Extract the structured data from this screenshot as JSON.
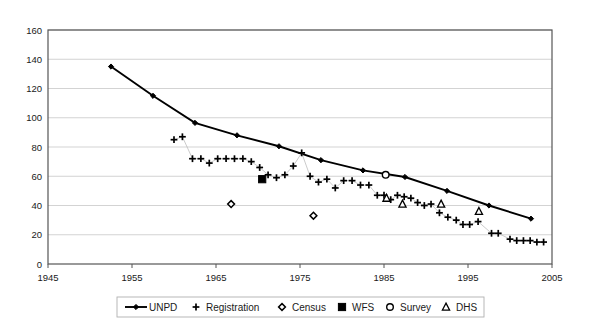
{
  "chart_data": {
    "type": "scatter",
    "title": "",
    "xlabel": "",
    "ylabel": "",
    "xlim": [
      1945,
      2005
    ],
    "ylim": [
      0,
      160
    ],
    "xticks": [
      1945,
      1955,
      1965,
      1975,
      1985,
      1995,
      2005
    ],
    "yticks": [
      0,
      20,
      40,
      60,
      80,
      100,
      120,
      140,
      160
    ],
    "grid": "horizontal",
    "legend_position": "bottom",
    "colors": {
      "line": "#000000",
      "marker": "#000000",
      "grid": "#c8c8c8",
      "frame": "#555555",
      "background": "#ffffff"
    },
    "series": [
      {
        "name": "UNPD",
        "marker": "line-diamond",
        "connected": true,
        "points": [
          {
            "x": 1952.5,
            "y": 135
          },
          {
            "x": 1957.5,
            "y": 115
          },
          {
            "x": 1962.5,
            "y": 96.5
          },
          {
            "x": 1967.5,
            "y": 88
          },
          {
            "x": 1972.5,
            "y": 80.5
          },
          {
            "x": 1977.5,
            "y": 71
          },
          {
            "x": 1982.5,
            "y": 64
          },
          {
            "x": 1987.5,
            "y": 59.5
          },
          {
            "x": 1992.5,
            "y": 50
          },
          {
            "x": 1997.5,
            "y": 40
          },
          {
            "x": 2002.5,
            "y": 31
          }
        ]
      },
      {
        "name": "Registration",
        "marker": "plus",
        "connected": true,
        "points": [
          {
            "x": 1960.0,
            "y": 85
          },
          {
            "x": 1961.0,
            "y": 87
          },
          {
            "x": 1962.2,
            "y": 72
          },
          {
            "x": 1963.2,
            "y": 72
          },
          {
            "x": 1964.2,
            "y": 69
          },
          {
            "x": 1965.2,
            "y": 72
          },
          {
            "x": 1966.2,
            "y": 72
          },
          {
            "x": 1967.2,
            "y": 72
          },
          {
            "x": 1968.2,
            "y": 72
          },
          {
            "x": 1969.2,
            "y": 70
          },
          {
            "x": 1970.2,
            "y": 66
          },
          {
            "x": 1971.2,
            "y": 61
          },
          {
            "x": 1972.2,
            "y": 59
          },
          {
            "x": 1973.2,
            "y": 61
          },
          {
            "x": 1974.2,
            "y": 67
          },
          {
            "x": 1975.2,
            "y": 76
          },
          {
            "x": 1976.2,
            "y": 60
          },
          {
            "x": 1977.2,
            "y": 56
          },
          {
            "x": 1978.2,
            "y": 58
          },
          {
            "x": 1979.2,
            "y": 52
          },
          {
            "x": 1980.2,
            "y": 57
          },
          {
            "x": 1981.2,
            "y": 57
          },
          {
            "x": 1982.2,
            "y": 54
          },
          {
            "x": 1983.2,
            "y": 54
          },
          {
            "x": 1984.2,
            "y": 47
          },
          {
            "x": 1985.0,
            "y": 47
          },
          {
            "x": 1985.8,
            "y": 44
          },
          {
            "x": 1986.6,
            "y": 47
          },
          {
            "x": 1987.4,
            "y": 46
          },
          {
            "x": 1988.2,
            "y": 45
          },
          {
            "x": 1989.0,
            "y": 42
          },
          {
            "x": 1989.8,
            "y": 40
          },
          {
            "x": 1990.6,
            "y": 41
          },
          {
            "x": 1991.6,
            "y": 35
          },
          {
            "x": 1992.6,
            "y": 32
          },
          {
            "x": 1993.6,
            "y": 30
          },
          {
            "x": 1994.4,
            "y": 27
          },
          {
            "x": 1995.2,
            "y": 27
          },
          {
            "x": 1996.2,
            "y": 29
          },
          {
            "x": 1997.8,
            "y": 21
          },
          {
            "x": 1998.6,
            "y": 21
          },
          {
            "x": 2000.0,
            "y": 17
          },
          {
            "x": 2000.8,
            "y": 16
          },
          {
            "x": 2001.6,
            "y": 16
          },
          {
            "x": 2002.4,
            "y": 16
          },
          {
            "x": 2003.2,
            "y": 15
          },
          {
            "x": 2004.0,
            "y": 15
          }
        ]
      },
      {
        "name": "Census",
        "marker": "diamond-open",
        "connected": false,
        "points": [
          {
            "x": 1966.8,
            "y": 41
          },
          {
            "x": 1976.6,
            "y": 33
          }
        ]
      },
      {
        "name": "WFS",
        "marker": "square-filled",
        "connected": false,
        "points": [
          {
            "x": 1970.5,
            "y": 58
          }
        ]
      },
      {
        "name": "Survey",
        "marker": "circle-open",
        "connected": false,
        "points": [
          {
            "x": 1985.2,
            "y": 61
          }
        ]
      },
      {
        "name": "DHS",
        "marker": "triangle-open",
        "connected": false,
        "points": [
          {
            "x": 1985.3,
            "y": 45
          },
          {
            "x": 1987.2,
            "y": 41
          },
          {
            "x": 1991.8,
            "y": 41
          },
          {
            "x": 1996.3,
            "y": 36
          }
        ]
      }
    ],
    "legend": [
      {
        "label": "UNPD",
        "marker": "line-diamond"
      },
      {
        "label": "Registration",
        "marker": "plus"
      },
      {
        "label": "Census",
        "marker": "diamond-open"
      },
      {
        "label": "WFS",
        "marker": "square-filled"
      },
      {
        "label": "Survey",
        "marker": "circle-open"
      },
      {
        "label": "DHS",
        "marker": "triangle-open"
      }
    ]
  }
}
